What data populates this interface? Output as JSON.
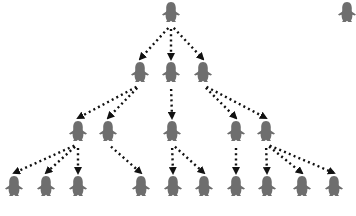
{
  "diagram": {
    "type": "tree",
    "node_shape": "penguin-silhouette-icon",
    "colors": {
      "node": "#6e6e6e",
      "edge": "#111111",
      "background": "#ffffff"
    },
    "nodes": [
      {
        "id": "n0",
        "level": 1,
        "x": 171,
        "y": 12
      },
      {
        "id": "s0",
        "level": 1,
        "x": 347,
        "y": 12,
        "standalone": true
      },
      {
        "id": "n1",
        "level": 2,
        "x": 140,
        "y": 72
      },
      {
        "id": "n2",
        "level": 2,
        "x": 171,
        "y": 72
      },
      {
        "id": "n3",
        "level": 2,
        "x": 203,
        "y": 72
      },
      {
        "id": "n4",
        "level": 3,
        "x": 78,
        "y": 131
      },
      {
        "id": "n5",
        "level": 3,
        "x": 108,
        "y": 131
      },
      {
        "id": "n6",
        "level": 3,
        "x": 172,
        "y": 131
      },
      {
        "id": "n7",
        "level": 3,
        "x": 236,
        "y": 131
      },
      {
        "id": "n8",
        "level": 3,
        "x": 266,
        "y": 131
      },
      {
        "id": "n9",
        "level": 4,
        "x": 14,
        "y": 186
      },
      {
        "id": "n10",
        "level": 4,
        "x": 46,
        "y": 186
      },
      {
        "id": "n11",
        "level": 4,
        "x": 78,
        "y": 186
      },
      {
        "id": "n12",
        "level": 4,
        "x": 141,
        "y": 186
      },
      {
        "id": "n13",
        "level": 4,
        "x": 173,
        "y": 186
      },
      {
        "id": "n14",
        "level": 4,
        "x": 204,
        "y": 186
      },
      {
        "id": "n15",
        "level": 4,
        "x": 236,
        "y": 186
      },
      {
        "id": "n16",
        "level": 4,
        "x": 267,
        "y": 186
      },
      {
        "id": "n17",
        "level": 4,
        "x": 302,
        "y": 186
      },
      {
        "id": "n18",
        "level": 4,
        "x": 334,
        "y": 186
      }
    ],
    "edges": [
      [
        "n0",
        "n1"
      ],
      [
        "n0",
        "n2"
      ],
      [
        "n0",
        "n3"
      ],
      [
        "n1",
        "n4"
      ],
      [
        "n1",
        "n5"
      ],
      [
        "n2",
        "n6"
      ],
      [
        "n3",
        "n7"
      ],
      [
        "n3",
        "n8"
      ],
      [
        "n4",
        "n9"
      ],
      [
        "n4",
        "n10"
      ],
      [
        "n4",
        "n11"
      ],
      [
        "n5",
        "n12"
      ],
      [
        "n6",
        "n13"
      ],
      [
        "n6",
        "n14"
      ],
      [
        "n7",
        "n15"
      ],
      [
        "n8",
        "n16"
      ],
      [
        "n8",
        "n17"
      ],
      [
        "n8",
        "n18"
      ]
    ],
    "edge_style": "dotted-arrow"
  }
}
